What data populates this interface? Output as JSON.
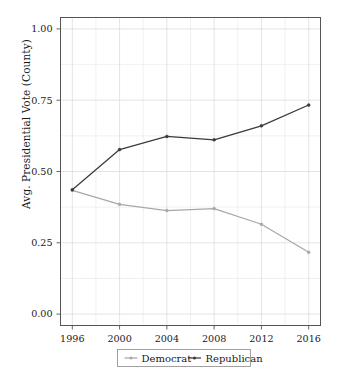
{
  "chart_data": {
    "type": "line",
    "title": "",
    "xlabel": "",
    "ylabel": "Avg. Presidential Vote (County)",
    "x": [
      1996,
      2000,
      2004,
      2008,
      2012,
      2016
    ],
    "xtick_labels": [
      "1996",
      "2000",
      "2004",
      "2008",
      "2012",
      "2016"
    ],
    "ytick_labels": [
      "0.00",
      "0.25",
      "0.50",
      "0.75",
      "1.00"
    ],
    "ytick_values": [
      0.0,
      0.25,
      0.5,
      0.75,
      1.0
    ],
    "xlim": [
      1995,
      2017
    ],
    "ylim": [
      -0.04,
      1.04
    ],
    "grid": true,
    "legend_position": "below-axes",
    "series": [
      {
        "name": "Democrat",
        "color": "#a8a8a8",
        "marker": "dot",
        "values": [
          0.434,
          0.385,
          0.363,
          0.37,
          0.315,
          0.217
        ]
      },
      {
        "name": "Republican",
        "color": "#3a3a3a",
        "marker": "dot",
        "values": [
          0.436,
          0.577,
          0.623,
          0.611,
          0.66,
          0.733
        ]
      }
    ]
  },
  "legend": {
    "items": [
      {
        "label": "Democrat"
      },
      {
        "label": "Republican"
      }
    ]
  },
  "colors": {
    "democrat": "#a8a8a8",
    "republican": "#3a3a3a",
    "grid": "#d9d9d9",
    "axis": "#555555",
    "text": "#1a1a1a",
    "background": "#ffffff"
  }
}
